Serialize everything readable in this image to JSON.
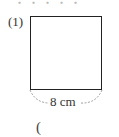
{
  "problem": {
    "number_label": "(1)",
    "top_cut_text": "・・・・・",
    "shape": "square",
    "side_length_label": "8 cm",
    "answer_open_paren": "("
  }
}
